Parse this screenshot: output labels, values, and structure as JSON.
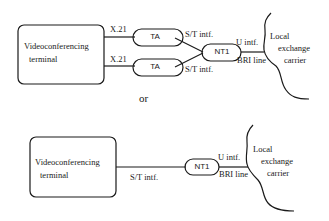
{
  "diagram": {
    "colors": {
      "stroke": "#1a1a1a",
      "background": "#ffffff"
    },
    "top_config": {
      "terminal": {
        "line1": "Videoconferencing",
        "line2": "terminal"
      },
      "links": [
        {
          "label": "X.21"
        },
        {
          "label": "X.21"
        }
      ],
      "adapters": [
        {
          "label": "TA"
        },
        {
          "label": "TA"
        }
      ],
      "st_labels": [
        "S/T intf.",
        "S/T intf."
      ],
      "nt1": {
        "label": "NT1"
      },
      "u_label": "U intf.",
      "bri_label": "BRI line",
      "carrier": {
        "line1": "Local",
        "line2": "exchange",
        "line3": "carrier"
      }
    },
    "separator": "or",
    "bottom_config": {
      "terminal": {
        "line1": "Videoconferencing",
        "line2": "terminal"
      },
      "st_label": "S/T intf.",
      "nt1": {
        "label": "NT1"
      },
      "u_label": "U intf.",
      "bri_label": "BRI line",
      "carrier": {
        "line1": "Local",
        "line2": "exchange",
        "line3": "carrier"
      }
    }
  }
}
